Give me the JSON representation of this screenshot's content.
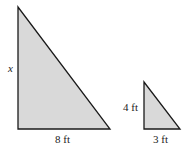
{
  "diagram": {
    "large_triangle": {
      "vertical_side_label": "x",
      "base_label": "8 ft"
    },
    "small_triangle": {
      "vertical_side_label": "4 ft",
      "base_label": "3 ft"
    },
    "colors": {
      "fill": "#d9d9d9",
      "stroke": "#1a1a1a"
    }
  }
}
